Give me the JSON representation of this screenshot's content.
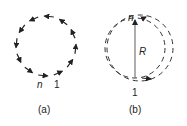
{
  "figure": {
    "panel_a": {
      "caption": "(a)",
      "label_n": "n",
      "label_1": "1",
      "arrow_count": 12,
      "direction": "counterclockwise"
    },
    "panel_b": {
      "caption": "(b)",
      "label_n": "n",
      "label_1": "1",
      "label_R": "R"
    },
    "colors": {
      "ink": "#222222",
      "dashed": "#333333",
      "line": "#777777"
    }
  }
}
